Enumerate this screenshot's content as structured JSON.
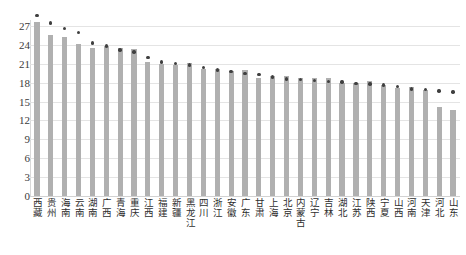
{
  "chart_data": {
    "type": "bar",
    "title": "",
    "subtitle": "",
    "xlabel": "",
    "ylabel": "",
    "ylim": [
      0,
      28.8
    ],
    "grid": true,
    "legend": "none",
    "yticks": [
      0,
      3,
      6,
      9,
      12,
      15,
      18,
      21,
      24,
      27
    ],
    "categories": [
      "西藏",
      "贵州",
      "海南",
      "云南",
      "湖南",
      "广西",
      "青海",
      "重庆",
      "江西",
      "福建",
      "新疆",
      "黑龙江",
      "四川",
      "浙江",
      "安徽",
      "广东",
      "甘肃",
      "上海",
      "北京",
      "内蒙古",
      "辽宁",
      "吉林",
      "湖北",
      "江苏",
      "陕西",
      "宁夏",
      "山西",
      "河南",
      "天津",
      "河北",
      "山东"
    ],
    "series": [
      {
        "name": "bar-series",
        "mark": "bar",
        "color": "#b0b0b0",
        "values": [
          27.7,
          25.6,
          25.2,
          24.2,
          23.5,
          23.9,
          23.5,
          23.4,
          21.3,
          21.0,
          20.8,
          21.1,
          20.2,
          20.1,
          19.8,
          20.0,
          18.8,
          19.1,
          19.1,
          18.7,
          18.7,
          18.7,
          17.9,
          18.0,
          18.2,
          17.6,
          17.2,
          17.3,
          16.8,
          14.1,
          13.7
        ]
      },
      {
        "name": "dot-series",
        "mark": "scatter",
        "color": "#3f3f3f",
        "values": [
          28.7,
          27.5,
          26.6,
          26.0,
          24.3,
          23.8,
          23.2,
          22.9,
          22.0,
          21.3,
          21.0,
          20.8,
          20.4,
          20.0,
          19.8,
          19.5,
          19.3,
          18.9,
          18.6,
          18.5,
          18.3,
          18.2,
          18.1,
          17.9,
          17.8,
          17.6,
          17.4,
          17.0,
          16.9,
          16.7,
          16.5
        ]
      }
    ]
  }
}
